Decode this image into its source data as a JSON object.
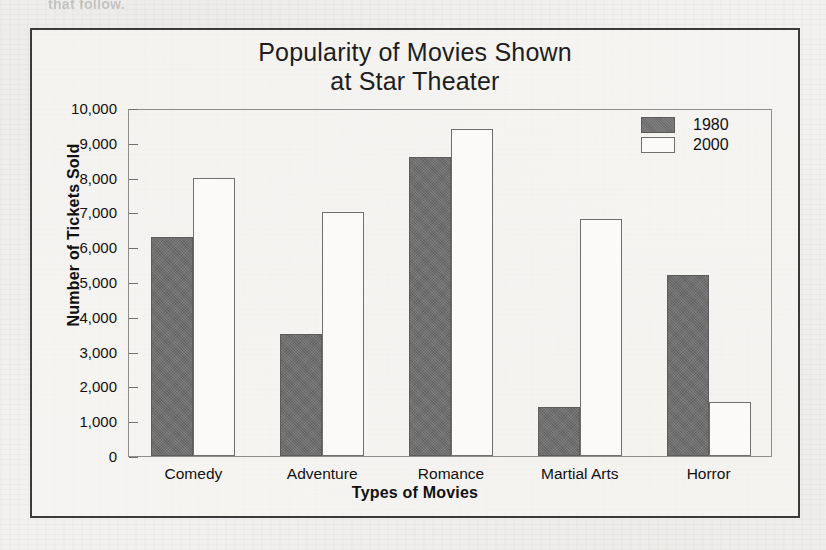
{
  "page": {
    "bleed_text_top": "that follow.",
    "bleed_text_right": "Some of the questions"
  },
  "chart_data": {
    "type": "bar",
    "title": "Popularity of Movies Shown at Star Theater",
    "title_line1": "Popularity of Movies Shown",
    "title_line2": "at Star Theater",
    "xlabel": "Types of Movies",
    "ylabel": "Number of Tickets Sold",
    "categories": [
      "Comedy",
      "Adventure",
      "Romance",
      "Martial Arts",
      "Horror"
    ],
    "series": [
      {
        "name": "1980",
        "color": "#6e6e6e",
        "values": [
          6300,
          3500,
          8600,
          1400,
          5200
        ]
      },
      {
        "name": "2000",
        "color": "#ffffff",
        "values": [
          8000,
          7000,
          9400,
          6800,
          1550
        ]
      }
    ],
    "ylim": [
      0,
      10000
    ],
    "ytick_values": [
      10000,
      9000,
      8000,
      7000,
      6000,
      5000,
      4000,
      3000,
      2000,
      1000,
      0
    ],
    "ytick_labels": [
      "10,000",
      "9,000",
      "8,000",
      "7,000",
      "6,000",
      "5,000",
      "4,000",
      "3,000",
      "2,000",
      "1,000",
      "0"
    ],
    "grid": false,
    "legend_position": "top-right"
  }
}
